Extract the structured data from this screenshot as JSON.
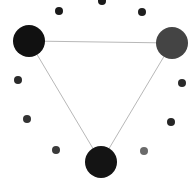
{
  "diagram": {
    "type": "network-graph",
    "background": "#ffffff",
    "edge_color": "#b8b8b8",
    "edge_width": 1,
    "hub_nodes": [
      {
        "id": "hub-top-left",
        "cx": 29,
        "cy": 41,
        "r": 16,
        "color": "#111111"
      },
      {
        "id": "hub-top-right",
        "cx": 172,
        "cy": 43,
        "r": 16,
        "color": "#444444"
      },
      {
        "id": "hub-bottom",
        "cx": 101,
        "cy": 162,
        "r": 16,
        "color": "#141414"
      }
    ],
    "edges": [
      {
        "from": "hub-top-left",
        "to": "hub-top-right"
      },
      {
        "from": "hub-top-left",
        "to": "hub-bottom"
      },
      {
        "from": "hub-top-right",
        "to": "hub-bottom"
      }
    ],
    "satellite_nodes": [
      {
        "cx": 59,
        "cy": 11,
        "r": 4,
        "color": "#1a1a1a"
      },
      {
        "cx": 102,
        "cy": 1,
        "r": 4,
        "color": "#1a1a1a"
      },
      {
        "cx": 142,
        "cy": 12,
        "r": 4,
        "color": "#1f1f1f"
      },
      {
        "cx": 18,
        "cy": 80,
        "r": 4,
        "color": "#2a2a2a"
      },
      {
        "cx": 182,
        "cy": 83,
        "r": 4,
        "color": "#2a2a2a"
      },
      {
        "cx": 27,
        "cy": 119,
        "r": 4,
        "color": "#333333"
      },
      {
        "cx": 171,
        "cy": 122,
        "r": 4,
        "color": "#262626"
      },
      {
        "cx": 56,
        "cy": 150,
        "r": 4,
        "color": "#3a3a3a"
      },
      {
        "cx": 144,
        "cy": 151,
        "r": 4,
        "color": "#6a6a6a"
      }
    ]
  }
}
